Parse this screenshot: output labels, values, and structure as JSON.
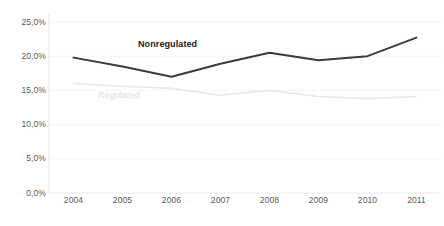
{
  "chart_data": {
    "type": "line",
    "title": "",
    "subtitle": "",
    "xlabel": "",
    "ylabel": "",
    "categories": [
      "2004",
      "2005",
      "2006",
      "2007",
      "2008",
      "2009",
      "2010",
      "2011"
    ],
    "x": [
      2004,
      2005,
      2006,
      2007,
      2008,
      2009,
      2010,
      2011
    ],
    "series": [
      {
        "name": "Nonregulated",
        "color": "#3b3b3b",
        "label_position": "above-line-2006-2007",
        "values": [
          19.8,
          18.5,
          17.0,
          18.9,
          20.5,
          19.4,
          20.0,
          22.7
        ]
      },
      {
        "name": "Regulated",
        "color": "#e8e8e8",
        "label_position": "below-line-2005-2006",
        "values": [
          16.0,
          15.6,
          15.3,
          14.3,
          15.0,
          14.1,
          13.8,
          14.1
        ]
      }
    ],
    "ylim": [
      0.0,
      25.0
    ],
    "ytick_values": [
      0.0,
      5.0,
      10.0,
      15.0,
      20.0,
      25.0
    ],
    "ytick_labels": [
      "0,0%",
      "5,0%",
      "10,0%",
      "15,0%",
      "20,0%",
      "25,0%"
    ],
    "xtick_labels": [
      "2004",
      "2005",
      "2006",
      "2007",
      "2008",
      "2009",
      "2010",
      "2011"
    ],
    "grid": {
      "horizontal": true,
      "vertical": false,
      "color": "#f4f4f6"
    },
    "legend": {
      "position": "inline-labels",
      "entries": [
        "Nonregulated",
        "Regulated"
      ]
    },
    "axis": {
      "left_axis_line_color": "#e6e6e8",
      "bottom_axis_line_color": "#f0f0f2"
    },
    "background_color": "#ffffff",
    "label_text_color": "#59595b"
  },
  "footer": {
    "note": ""
  }
}
